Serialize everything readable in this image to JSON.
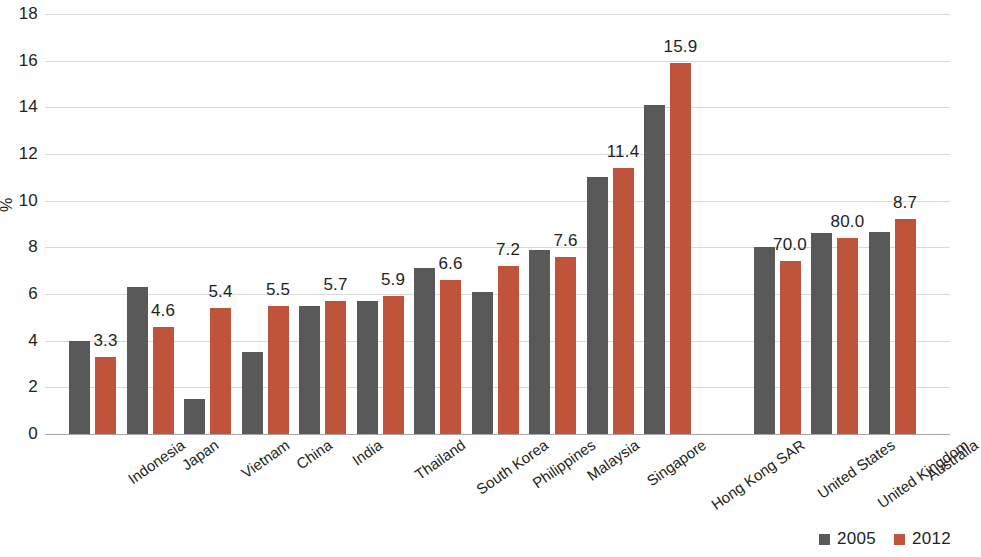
{
  "chart_data": {
    "type": "bar",
    "title": "",
    "subtitle": "",
    "xlabel": "",
    "ylabel": "%",
    "ylim": [
      0,
      18
    ],
    "ytick_step": 2,
    "yticks": [
      "18",
      "16",
      "14",
      "12",
      "10",
      "8",
      "6",
      "4",
      "2",
      "0"
    ],
    "grid": true,
    "legend_position": "bottom-right",
    "categories": [
      "Indonesia",
      "Japan",
      "Vietnam",
      "China",
      "India",
      "Thailand",
      "South Korea",
      "Philippines",
      "Malaysia",
      "Singapore",
      "Hong Kong SAR",
      "United States",
      "United Kingdom",
      "Australia"
    ],
    "series": [
      {
        "name": "2005",
        "color": "#595959",
        "values": [
          4.0,
          6.3,
          1.5,
          3.5,
          5.5,
          5.7,
          7.1,
          6.1,
          7.9,
          11.0,
          14.1,
          8.0,
          8.6,
          8.65
        ]
      },
      {
        "name": "2012",
        "color": "#c0543a",
        "values": [
          3.3,
          4.6,
          5.4,
          5.5,
          5.7,
          5.9,
          6.6,
          7.2,
          7.6,
          11.4,
          15.9,
          7.4,
          8.4,
          9.2
        ]
      }
    ],
    "data_labels": [
      "3.3",
      "4.6",
      "5.4",
      "5.5",
      "5.7",
      "5.9",
      "6.6",
      "7.2",
      "7.6",
      "11.4",
      "15.9",
      "70.0",
      "80.0",
      "8.7"
    ],
    "group_break_after_index": 10
  },
  "legend": {
    "items": [
      {
        "label": "2005",
        "color": "#595959"
      },
      {
        "label": "2012",
        "color": "#c0543a"
      }
    ]
  }
}
